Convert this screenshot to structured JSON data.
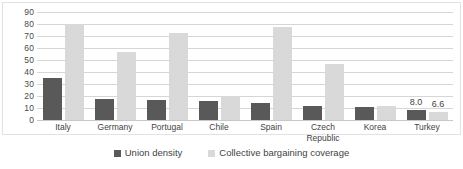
{
  "chart_data": {
    "type": "bar",
    "title": "",
    "subtitle": "",
    "xlabel": "",
    "ylabel": "",
    "ylim": [
      0,
      90
    ],
    "ytick_step": 10,
    "yticks": [
      90,
      80,
      70,
      60,
      50,
      40,
      30,
      20,
      10,
      0
    ],
    "grid": true,
    "legend_position": "bottom",
    "categories": [
      "Italy",
      "Germany",
      "Portugal",
      "Chile",
      "Spain",
      "Czech\nRepublic",
      "Korea",
      "Turkey"
    ],
    "series": [
      {
        "name": "Union density",
        "color": "#595959",
        "values": [
          35.0,
          17.5,
          16.3,
          15.6,
          14.2,
          12.0,
          10.7,
          8.0
        ],
        "data_labels": [
          "",
          "",
          "",
          "",
          "",
          "",
          "",
          "8.0"
        ]
      },
      {
        "name": "Collective bargaining coverage",
        "color": "#d9d9d9",
        "values": [
          80.0,
          56.8,
          72.2,
          20.2,
          77.6,
          46.8,
          12.0,
          6.6
        ],
        "data_labels": [
          "",
          "",
          "",
          "",
          "",
          "",
          "",
          "6.6"
        ]
      }
    ],
    "annotations": [
      {
        "text": "8.0",
        "series": "Union density",
        "category": "Turkey"
      },
      {
        "text": "6.6",
        "series": "Collective bargaining coverage",
        "category": "Turkey"
      }
    ]
  },
  "legend": {
    "items": [
      {
        "label": "Union density",
        "color": "#595959"
      },
      {
        "label": "Collective bargaining coverage",
        "color": "#d9d9d9"
      }
    ]
  },
  "colors": {
    "series_union_density": "#595959",
    "series_bargaining_coverage": "#d9d9d9",
    "gridline": "#d6d6d6",
    "frame": "#e2e2e2",
    "text": "#3f3f3f",
    "background": "#ffffff"
  }
}
